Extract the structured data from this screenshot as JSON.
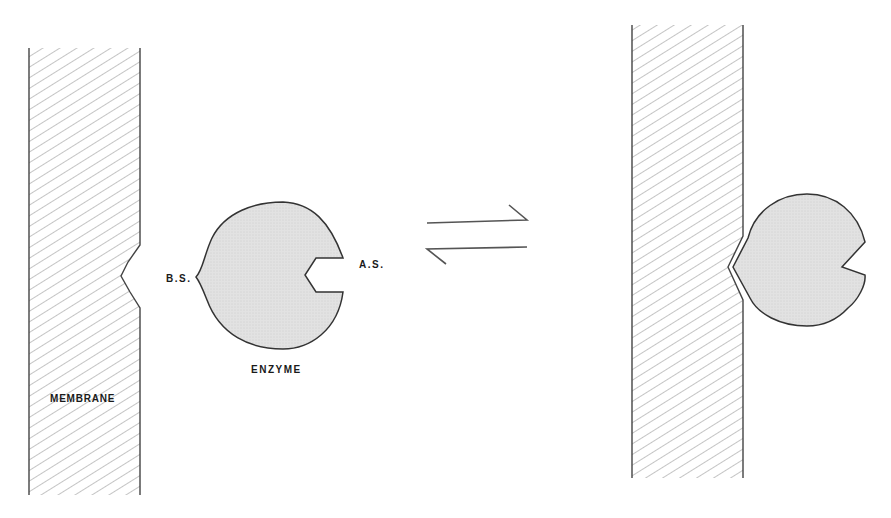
{
  "diagram": {
    "type": "enzyme-membrane binding equilibrium",
    "labels": {
      "binding_site": "B.S.",
      "active_site": "A.S.",
      "enzyme": "ENZYME",
      "membrane": "MEMBRANE"
    },
    "equilibrium_symbol": "reversible-arrows",
    "colors": {
      "stroke": "#333333",
      "hatch": "#8a8a8a",
      "enzyme_fill": "#dcdcdc",
      "background": "#ffffff"
    },
    "panels": [
      {
        "name": "unbound-state",
        "description": "Free enzyme beside membrane with notch"
      },
      {
        "name": "bound-state",
        "description": "Enzyme bound at membrane notch via binding site"
      }
    ]
  }
}
